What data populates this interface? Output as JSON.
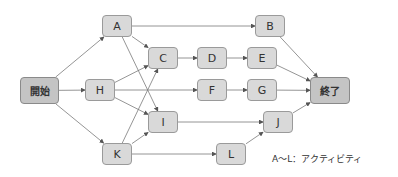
{
  "diagram": {
    "type": "activity-network",
    "nodes": [
      {
        "id": "start",
        "label": "開始",
        "x": 20,
        "y": 77,
        "w": 39,
        "h": 27,
        "terminal": true
      },
      {
        "id": "A",
        "label": "A",
        "x": 102,
        "y": 15,
        "w": 30,
        "h": 22
      },
      {
        "id": "H",
        "label": "H",
        "x": 85,
        "y": 79,
        "w": 30,
        "h": 22
      },
      {
        "id": "K",
        "label": "K",
        "x": 102,
        "y": 143,
        "w": 30,
        "h": 22
      },
      {
        "id": "C",
        "label": "C",
        "x": 148,
        "y": 47,
        "w": 30,
        "h": 22
      },
      {
        "id": "I",
        "label": "I",
        "x": 148,
        "y": 111,
        "w": 30,
        "h": 22
      },
      {
        "id": "D",
        "label": "D",
        "x": 197,
        "y": 47,
        "w": 30,
        "h": 22
      },
      {
        "id": "F",
        "label": "F",
        "x": 197,
        "y": 79,
        "w": 30,
        "h": 22
      },
      {
        "id": "E",
        "label": "E",
        "x": 247,
        "y": 47,
        "w": 30,
        "h": 22
      },
      {
        "id": "G",
        "label": "G",
        "x": 247,
        "y": 79,
        "w": 30,
        "h": 22
      },
      {
        "id": "B",
        "label": "B",
        "x": 255,
        "y": 15,
        "w": 30,
        "h": 22
      },
      {
        "id": "L",
        "label": "L",
        "x": 216,
        "y": 143,
        "w": 30,
        "h": 22
      },
      {
        "id": "J",
        "label": "J",
        "x": 263,
        "y": 111,
        "w": 30,
        "h": 22
      },
      {
        "id": "end",
        "label": "終了",
        "x": 310,
        "y": 77,
        "w": 40,
        "h": 27,
        "terminal": true
      }
    ],
    "edges": [
      [
        "start",
        "A"
      ],
      [
        "start",
        "H"
      ],
      [
        "start",
        "K"
      ],
      [
        "A",
        "B"
      ],
      [
        "A",
        "C"
      ],
      [
        "A",
        "I"
      ],
      [
        "H",
        "C"
      ],
      [
        "H",
        "F"
      ],
      [
        "H",
        "I"
      ],
      [
        "K",
        "C"
      ],
      [
        "K",
        "I"
      ],
      [
        "K",
        "L"
      ],
      [
        "C",
        "D"
      ],
      [
        "D",
        "E"
      ],
      [
        "F",
        "G"
      ],
      [
        "I",
        "J"
      ],
      [
        "L",
        "J"
      ],
      [
        "B",
        "end"
      ],
      [
        "E",
        "end"
      ],
      [
        "G",
        "end"
      ],
      [
        "J",
        "end"
      ]
    ],
    "colors": {
      "node_fill": "#d9d9d9",
      "terminal_fill": "#c4c4c4",
      "border": "#9a9a9a",
      "edge": "#7a7a7a"
    }
  },
  "legend": {
    "text": "A～L：アクティビティ"
  }
}
